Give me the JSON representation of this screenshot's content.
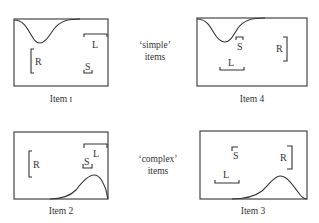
{
  "figure": {
    "middle_labels": {
      "simple": [
        "‘simple’",
        "items"
      ],
      "complex": [
        "‘complex’",
        "items"
      ]
    },
    "items": [
      {
        "caption": "Item 1",
        "caption_numeral": "Item ɪ",
        "curve": "trough-top-left",
        "labels": {
          "R": "R",
          "L": "L",
          "S": "S"
        }
      },
      {
        "caption": "Item 4",
        "caption_numeral": "Item 4",
        "curve": "trough-top-left",
        "labels": {
          "R": "R",
          "L": "L",
          "S": "S"
        }
      },
      {
        "caption": "Item 2",
        "caption_numeral": "Item 2",
        "curve": "hump-bottom-right",
        "labels": {
          "R": "R",
          "L": "L",
          "S": "S"
        }
      },
      {
        "caption": "Item 3",
        "caption_numeral": "Item 3",
        "curve": "hump-bottom-right",
        "labels": {
          "R": "R",
          "L": "L",
          "S": "S"
        }
      }
    ]
  }
}
